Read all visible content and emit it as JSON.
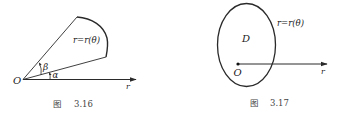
{
  "figures": [
    {
      "id": "fig-3-16",
      "caption_prefix": "图",
      "caption_number": "3.16",
      "labels": {
        "origin": "O",
        "axis": "r",
        "curve": "r=r(θ)",
        "angle_upper": "β",
        "angle_lower": "α"
      }
    },
    {
      "id": "fig-3-17",
      "caption_prefix": "图",
      "caption_number": "3.17",
      "labels": {
        "origin": "O",
        "axis": "r",
        "curve": "r=r(θ)",
        "region": "D"
      }
    }
  ],
  "colors": {
    "stroke": "#2a2a2a",
    "text": "#222222",
    "caption": "#444444"
  }
}
